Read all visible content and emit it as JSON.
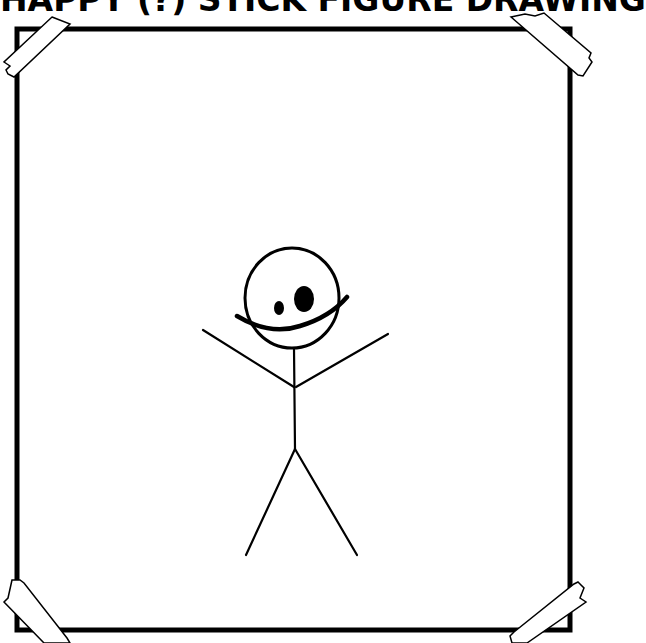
{
  "title": "HAPPY (?) STICK FIGURE DRAWING",
  "colors": {
    "background": "#ffffff",
    "ink": "#000000",
    "tape": "#ffffff"
  },
  "drawing": {
    "frame": "taped-paper-frame",
    "subject": "stick-figure",
    "features": [
      "round-head",
      "two-uneven-eyes",
      "wide-smile",
      "raised-arms",
      "two-legs"
    ]
  }
}
